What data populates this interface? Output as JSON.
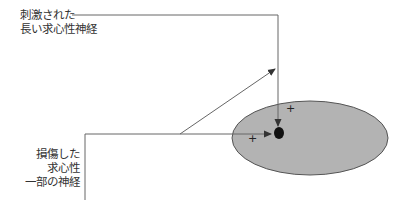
{
  "diagram": {
    "labels": {
      "stimulated_nerve": [
        "刺激された",
        "長い求心性神経"
      ],
      "damaged_nerve": [
        "損傷した",
        "求心性",
        "一部の神経"
      ]
    },
    "symbols": {
      "plus_1": "+",
      "plus_2": "+"
    },
    "colors": {
      "ellipse_fill": "#b3b3b3",
      "ellipse_stroke": "#555555",
      "line": "#555555",
      "dot": "#111111",
      "text": "#333333"
    }
  }
}
